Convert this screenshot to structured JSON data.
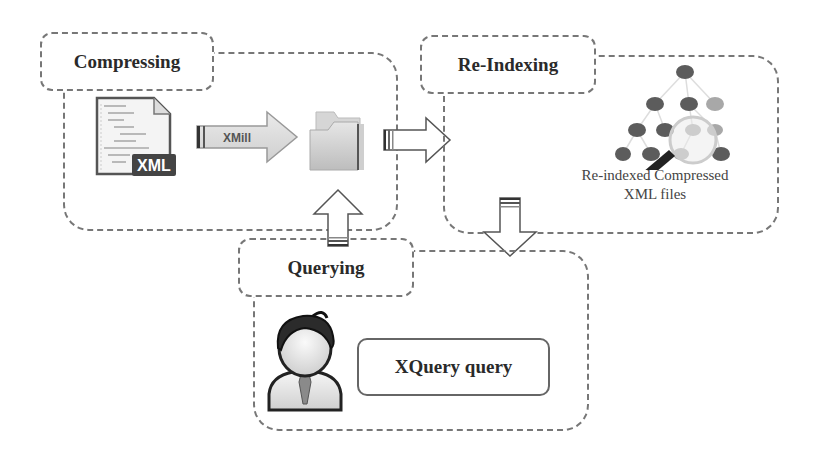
{
  "diagram": {
    "stages": [
      {
        "id": "compressing",
        "label": "Compressing"
      },
      {
        "id": "re-indexing",
        "label": "Re-Indexing"
      },
      {
        "id": "querying",
        "label": "Querying"
      }
    ],
    "compressing": {
      "label": "Compressing",
      "file_icon_label": "XML",
      "arrow_label": "XMill",
      "output_icon": "folder-icon"
    },
    "reindexing": {
      "label": "Re-Indexing",
      "icon": "tree-search-icon",
      "caption_line1": "Re-indexed Compressed",
      "caption_line2": "XML files"
    },
    "querying": {
      "label": "Querying",
      "icon": "user-avatar-icon",
      "query_box_label": "XQuery query"
    },
    "connections": [
      {
        "from": "compressing",
        "to": "re-indexing",
        "direction": "right"
      },
      {
        "from": "re-indexing",
        "to": "querying",
        "direction": "down"
      },
      {
        "from": "querying",
        "to": "compressing",
        "direction": "up"
      }
    ],
    "colors": {
      "dash_border": "#777777",
      "text": "#2a2a2a",
      "node_dark": "#666666",
      "node_light": "#aaaaaa"
    }
  }
}
